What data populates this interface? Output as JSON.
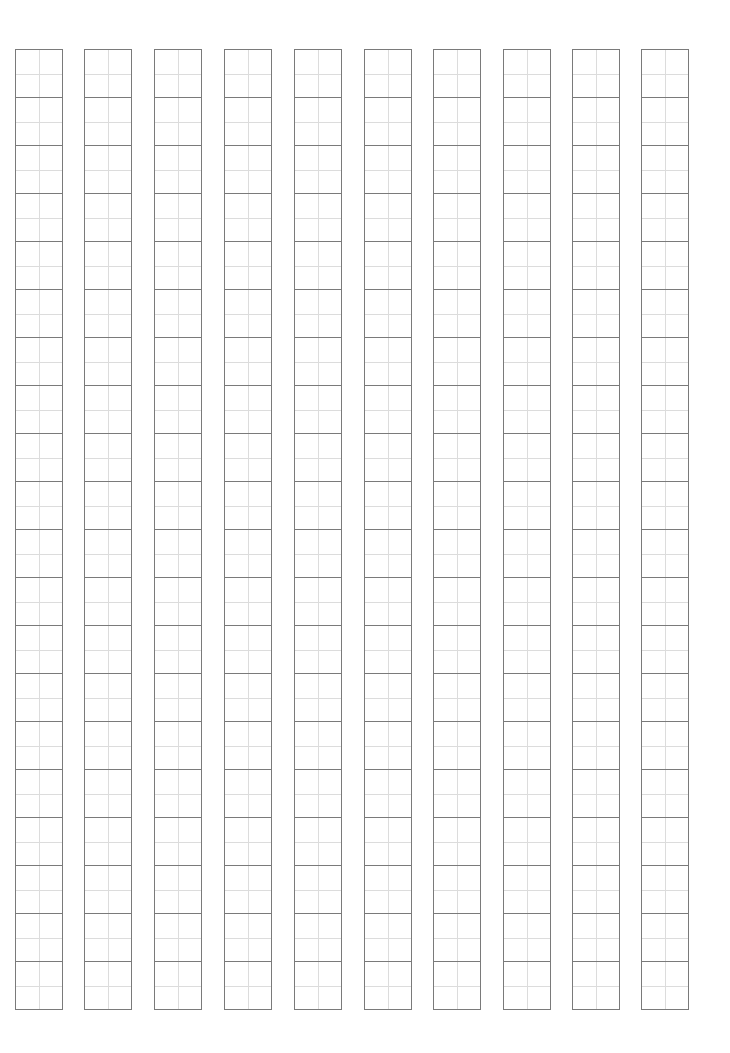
{
  "document": {
    "type": "tianzige-practice-sheet",
    "columns": 10,
    "rows_per_column": 20,
    "column_left_positions_px": [
      15,
      84,
      154,
      224,
      294,
      364,
      433,
      503,
      572,
      641
    ],
    "colors": {
      "background": "#ffffff",
      "outer_line": "#7a7a7a",
      "guide_line": "#dcdcdc"
    }
  }
}
